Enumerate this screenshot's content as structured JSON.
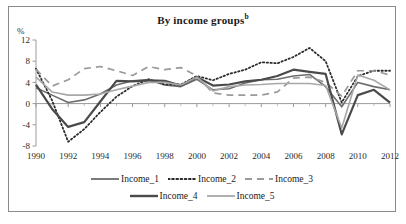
{
  "figure": {
    "title": "By income groups",
    "title_superscript": "b",
    "unit_label": "%"
  },
  "chart_data": {
    "type": "line",
    "title": "By income groups",
    "xlabel": "",
    "ylabel": "%",
    "ylim": [
      -8,
      12
    ],
    "xlim": [
      1990,
      2012
    ],
    "yticks": [
      12,
      8,
      4,
      0,
      -4,
      -8
    ],
    "xticks": [
      1990,
      1992,
      1994,
      1996,
      1998,
      2000,
      2002,
      2004,
      2006,
      2008,
      2010,
      2012
    ],
    "grid": false,
    "legend_position": "bottom",
    "x": [
      1990,
      1991,
      1992,
      1993,
      1994,
      1995,
      1996,
      1997,
      1998,
      1999,
      2000,
      2001,
      2002,
      2003,
      2004,
      2005,
      2006,
      2007,
      2008,
      2009,
      2010,
      2011,
      2012
    ],
    "series": [
      {
        "name": "Income_1",
        "style": "solid",
        "color": "#6d6d6d",
        "width": 1.6,
        "values": [
          3.0,
          1.6,
          0.2,
          0.7,
          1.8,
          3.5,
          4.3,
          4.5,
          3.5,
          3.2,
          4.6,
          2.6,
          2.8,
          3.9,
          4.5,
          4.6,
          5.2,
          5.5,
          3.2,
          -0.6,
          4.0,
          3.2,
          2.6
        ]
      },
      {
        "name": "Income_2",
        "style": "dotted",
        "color": "#2b2b2b",
        "width": 1.8,
        "values": [
          6.6,
          0.6,
          -7.2,
          -4.8,
          -1.6,
          1.3,
          3.3,
          4.6,
          3.6,
          3.6,
          5.2,
          4.4,
          5.6,
          6.4,
          7.8,
          7.6,
          8.8,
          10.5,
          8.0,
          0.2,
          5.2,
          6.2,
          6.2
        ]
      },
      {
        "name": "Income_3",
        "style": "dashed",
        "color": "#9a9a9a",
        "width": 1.7,
        "values": [
          6.5,
          3.3,
          4.5,
          6.6,
          7.0,
          6.2,
          5.3,
          7.0,
          6.4,
          6.8,
          5.2,
          2.0,
          1.6,
          1.6,
          1.6,
          2.2,
          4.8,
          5.0,
          4.0,
          1.4,
          6.2,
          6.2,
          5.4
        ]
      },
      {
        "name": "Income_4",
        "style": "solid",
        "color": "#4a4a4a",
        "width": 2.2,
        "values": [
          3.6,
          -1.0,
          -4.4,
          -3.5,
          0.4,
          4.3,
          4.2,
          4.4,
          4.3,
          3.4,
          5.0,
          3.4,
          3.6,
          4.2,
          4.5,
          5.2,
          6.4,
          6.0,
          5.6,
          -5.8,
          1.6,
          2.6,
          0.2
        ]
      },
      {
        "name": "Income_5",
        "style": "solid",
        "color": "#a8a8a8",
        "width": 1.6,
        "values": [
          5.0,
          2.2,
          1.6,
          1.6,
          1.8,
          2.6,
          3.3,
          4.0,
          4.0,
          3.5,
          5.0,
          2.4,
          3.2,
          3.5,
          3.6,
          3.8,
          3.8,
          3.8,
          3.4,
          -4.6,
          5.4,
          4.4,
          2.6
        ]
      }
    ]
  },
  "legend": {
    "rows": [
      [
        {
          "label": "Income_1",
          "series": 0
        },
        {
          "label": "Income_2",
          "series": 1
        },
        {
          "label": "Income_3",
          "series": 2
        }
      ],
      [
        {
          "label": "Income_4",
          "series": 3
        },
        {
          "label": "Income_5",
          "series": 4
        }
      ]
    ]
  }
}
